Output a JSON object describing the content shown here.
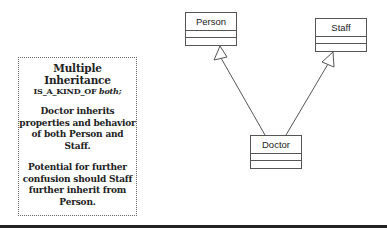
{
  "note": {
    "title": "Multiple Inheritance",
    "subtitle_prefix": "IS_A_KIND_OF ",
    "subtitle_emph": "both;",
    "paragraph1": "Doctor inherits properties and behavior of both Person and Staff.",
    "paragraph2": "Potential for further confusion should Staff further inherit from Person."
  },
  "classes": {
    "person": {
      "name": "Person"
    },
    "staff": {
      "name": "Staff"
    },
    "doctor": {
      "name": "Doctor"
    }
  },
  "relationships": [
    {
      "type": "generalization",
      "from": "Doctor",
      "to": "Person"
    },
    {
      "type": "generalization",
      "from": "Doctor",
      "to": "Staff"
    }
  ],
  "colors": {
    "line": "#555555",
    "text": "#222222",
    "rule": "#222222"
  }
}
